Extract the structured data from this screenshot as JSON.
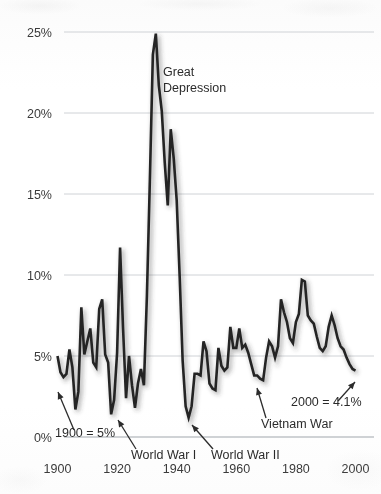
{
  "chart_data": {
    "type": "line",
    "title": "",
    "subtitle": "",
    "xlabel": "",
    "ylabel": "",
    "xlim": [
      1900,
      2000
    ],
    "ylim": [
      0,
      27
    ],
    "grid": true,
    "legend": "none",
    "y_ticks": [
      "0%",
      "5%",
      "10%",
      "15%",
      "20%",
      "25%"
    ],
    "y_tick_values": [
      0,
      5,
      10,
      15,
      20,
      25
    ],
    "x_ticks": [
      "1900",
      "1920",
      "1940",
      "1960",
      "1980",
      "2000"
    ],
    "x_tick_values": [
      1900,
      1920,
      1940,
      1960,
      1980,
      2000
    ],
    "series": [
      {
        "name": "Unemployment rate",
        "x": [
          1900,
          1901,
          1902,
          1903,
          1904,
          1905,
          1906,
          1907,
          1908,
          1909,
          1910,
          1911,
          1912,
          1913,
          1914,
          1915,
          1916,
          1917,
          1918,
          1919,
          1920,
          1921,
          1922,
          1923,
          1924,
          1925,
          1926,
          1927,
          1928,
          1929,
          1930,
          1931,
          1932,
          1933,
          1934,
          1935,
          1936,
          1937,
          1938,
          1939,
          1940,
          1941,
          1942,
          1943,
          1944,
          1945,
          1946,
          1947,
          1948,
          1949,
          1950,
          1951,
          1952,
          1953,
          1954,
          1955,
          1956,
          1957,
          1958,
          1959,
          1960,
          1961,
          1962,
          1963,
          1964,
          1965,
          1966,
          1967,
          1968,
          1969,
          1970,
          1971,
          1972,
          1973,
          1974,
          1975,
          1976,
          1977,
          1978,
          1979,
          1980,
          1981,
          1982,
          1983,
          1984,
          1985,
          1986,
          1987,
          1988,
          1989,
          1990,
          1991,
          1992,
          1993,
          1994,
          1995,
          1996,
          1997,
          1998,
          1999,
          2000
        ],
        "values": [
          5.0,
          4.0,
          3.7,
          3.9,
          5.4,
          4.3,
          1.7,
          2.8,
          8.0,
          5.1,
          5.9,
          6.7,
          4.6,
          4.3,
          7.9,
          8.5,
          5.1,
          4.6,
          1.4,
          2.3,
          5.2,
          11.7,
          6.7,
          2.4,
          5.0,
          3.2,
          1.8,
          3.3,
          4.2,
          3.2,
          8.7,
          15.9,
          23.6,
          24.9,
          21.7,
          20.1,
          16.9,
          14.3,
          19.0,
          17.2,
          14.6,
          9.9,
          4.7,
          1.9,
          1.2,
          1.9,
          3.9,
          3.9,
          3.8,
          5.9,
          5.3,
          3.3,
          3.0,
          2.9,
          5.5,
          4.4,
          4.1,
          4.3,
          6.8,
          5.5,
          5.5,
          6.7,
          5.5,
          5.7,
          5.2,
          4.5,
          3.8,
          3.8,
          3.6,
          3.5,
          4.9,
          5.9,
          5.6,
          4.9,
          5.6,
          8.5,
          7.7,
          7.1,
          6.1,
          5.8,
          7.1,
          7.6,
          9.7,
          9.6,
          7.5,
          7.2,
          7.0,
          6.2,
          5.5,
          5.3,
          5.6,
          6.8,
          7.5,
          6.9,
          6.1,
          5.6,
          5.4,
          4.9,
          4.5,
          4.2,
          4.1
        ],
        "units": "percent"
      }
    ],
    "annotations": [
      {
        "id": "great-depression",
        "label": "Great Depression",
        "x_text": 163,
        "y_text": 76,
        "has_arrow": false
      },
      {
        "id": "year-1900-value",
        "label": "1900 = 5%",
        "x_text": 55,
        "y_text": 437,
        "has_arrow": true,
        "arrow_from": [
          74,
          430
        ],
        "arrow_to": [
          58,
          392
        ]
      },
      {
        "id": "world-war-i",
        "label": "World War I",
        "x_text": 131,
        "y_text": 459,
        "has_arrow": true,
        "arrow_from": [
          136,
          449
        ],
        "arrow_to": [
          118,
          420
        ]
      },
      {
        "id": "world-war-ii",
        "label": "World War II",
        "x_text": 211,
        "y_text": 459,
        "has_arrow": true,
        "arrow_from": [
          213,
          449
        ],
        "arrow_to": [
          192,
          425
        ]
      },
      {
        "id": "vietnam-war",
        "label": "Vietnam War",
        "x_text": 261,
        "y_text": 428,
        "has_arrow": true,
        "arrow_from": [
          266,
          418
        ],
        "arrow_to": [
          257,
          388
        ]
      },
      {
        "id": "year-2000-value",
        "label": "2000 = 4.1%",
        "x_text": 291,
        "y_text": 406,
        "has_arrow": true,
        "arrow_from": [
          338,
          401
        ],
        "arrow_to": [
          355,
          382
        ]
      }
    ]
  },
  "colors": {
    "line": "#242424",
    "gridline": "#cfd2d6",
    "axis": "#bfc3c7",
    "text": "#3b3b3b",
    "background": "#fdfdfd"
  }
}
